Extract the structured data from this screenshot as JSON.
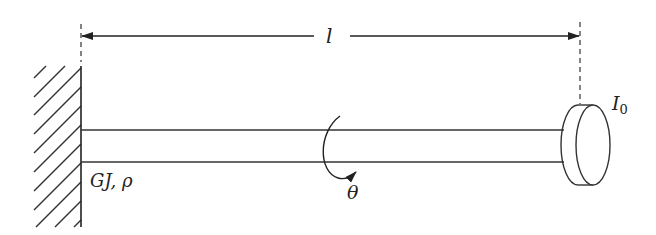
{
  "diagram": {
    "labels": {
      "length": "l",
      "shaft_properties": "GJ, ρ",
      "rotation": "θ",
      "disk_inertia_main": "I",
      "disk_inertia_sub": "0"
    },
    "colors": {
      "stroke": "#333333",
      "background": "#ffffff"
    },
    "elements": [
      {
        "name": "fixed-wall",
        "type": "hatched-support",
        "x": 81,
        "y_range": [
          66,
          226
        ]
      },
      {
        "name": "shaft",
        "type": "rod",
        "x_range": [
          81,
          577
        ],
        "y_top": 130,
        "y_bottom": 162
      },
      {
        "name": "rotor-disk",
        "type": "cylinder-disk",
        "cx": 593,
        "cy": 145
      },
      {
        "name": "length-dimension",
        "type": "double-arrow",
        "x_range": [
          81,
          580
        ],
        "y": 36
      },
      {
        "name": "rotation-arrow",
        "type": "curved-arrow",
        "cx": 330,
        "cy": 150
      }
    ]
  }
}
